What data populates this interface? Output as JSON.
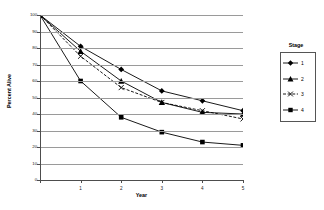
{
  "chart_data": {
    "type": "line",
    "title": "",
    "xlabel": "Year",
    "ylabel": "Percent Alive",
    "x": [
      0,
      1,
      2,
      3,
      4,
      5
    ],
    "xticklabels": [
      "0",
      "1",
      "2",
      "3",
      "4",
      "5"
    ],
    "yticklabels": [
      "100",
      "90",
      "80",
      "70",
      "60",
      "50",
      "40",
      "30",
      "20",
      "10",
      "0"
    ],
    "xlim": [
      0,
      5
    ],
    "ylim": [
      0,
      100
    ],
    "grid": "horizontal",
    "legend_title": "Stage",
    "legend_position": "right",
    "series": [
      {
        "name": "1",
        "values": [
          100,
          81,
          67,
          54,
          48,
          42
        ],
        "marker": "diamond",
        "linestyle": "solid",
        "color": "#000000"
      },
      {
        "name": "2",
        "values": [
          100,
          78,
          60,
          47,
          41,
          40
        ],
        "marker": "triangle",
        "linestyle": "solid",
        "color": "#000000"
      },
      {
        "name": "3",
        "values": [
          100,
          75,
          56,
          47,
          42,
          37
        ],
        "marker": "cross",
        "linestyle": "dashed",
        "color": "#000000"
      },
      {
        "name": "4",
        "values": [
          100,
          60,
          38,
          29,
          23,
          21
        ],
        "marker": "square",
        "linestyle": "solid",
        "color": "#000000"
      }
    ]
  },
  "legend": {
    "title": "Stage",
    "items": [
      {
        "label": "1"
      },
      {
        "label": "2"
      },
      {
        "label": "3"
      },
      {
        "label": "4"
      }
    ]
  },
  "axes": {
    "x_title": "Year",
    "y_title": "Percent Alive"
  }
}
